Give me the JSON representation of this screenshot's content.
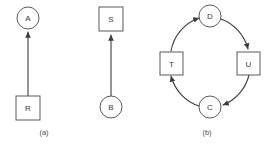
{
  "figure": {
    "background_color": "#ffffff",
    "stroke_color": "#5b5b5b",
    "edge_color": "#3c3c3c",
    "text_color": "#3a3a3a",
    "panels": [
      {
        "id": "a",
        "caption": "(a)",
        "nodes": [
          {
            "label": "A",
            "shape": "circle",
            "x": 28,
            "y": 18,
            "r": 11
          },
          {
            "label": "R",
            "shape": "square",
            "x": 28,
            "y": 108,
            "size": 24
          }
        ],
        "edges": [
          {
            "from": "R",
            "to": "A",
            "arrow_at": "A",
            "style": "straight"
          }
        ]
      },
      {
        "id": "b",
        "caption": "(b)",
        "nodes": [
          {
            "label": "S",
            "shape": "square",
            "x": 23,
            "y": 19,
            "size": 24
          },
          {
            "label": "B",
            "shape": "circle",
            "x": 23,
            "y": 107,
            "r": 11
          }
        ],
        "edges": [
          {
            "from": "B",
            "to": "S",
            "arrow_at": "S",
            "style": "straight"
          }
        ]
      },
      {
        "id": "c",
        "caption": "(c)",
        "nodes": [
          {
            "label": "D",
            "shape": "circle",
            "x": 60,
            "y": 16,
            "r": 11
          },
          {
            "label": "U",
            "shape": "square",
            "x": 98,
            "y": 63,
            "size": 23
          },
          {
            "label": "C",
            "shape": "circle",
            "x": 60,
            "y": 107,
            "r": 11
          },
          {
            "label": "T",
            "shape": "square",
            "x": 21,
            "y": 63,
            "size": 23
          }
        ],
        "edges": [
          {
            "from": "T",
            "to": "D",
            "arrow_at": "D",
            "style": "arc"
          },
          {
            "from": "D",
            "to": "U",
            "arrow_at": "U",
            "style": "arc"
          },
          {
            "from": "U",
            "to": "C",
            "arrow_at": "C",
            "style": "arc"
          },
          {
            "from": "C",
            "to": "T",
            "arrow_at": "T",
            "style": "arc"
          }
        ]
      }
    ]
  }
}
